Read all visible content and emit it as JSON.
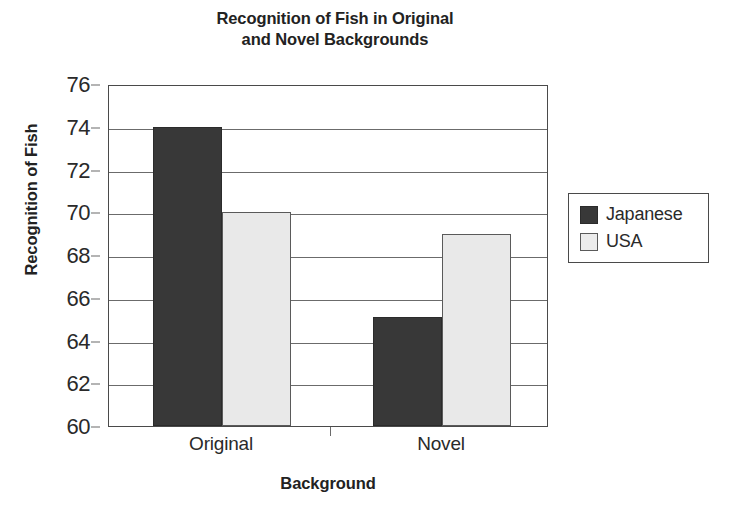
{
  "chart_data": {
    "type": "bar",
    "title": "Recognition of Fish in Original and Novel Backgrounds",
    "title_line1": "Recognition of Fish in Original",
    "title_line2": "and Novel Backgrounds",
    "xlabel": "Background",
    "ylabel": "Recognition of Fish",
    "categories": [
      "Original",
      "Novel"
    ],
    "series": [
      {
        "name": "Japanese",
        "values": [
          74,
          65.1
        ],
        "color": "#383838"
      },
      {
        "name": "USA",
        "values": [
          70,
          69
        ],
        "color": "#e9e9e9"
      }
    ],
    "ylim": [
      60,
      76
    ],
    "yticks": [
      60,
      62,
      64,
      66,
      68,
      70,
      72,
      74,
      76
    ],
    "ytick_labels": [
      "60",
      "62",
      "64",
      "66",
      "68",
      "70",
      "72",
      "74",
      "76"
    ],
    "grid": true,
    "grid_axis": "y",
    "legend_position": "right",
    "legend_entries": [
      "Japanese",
      "USA"
    ],
    "background_color": "#ffffff",
    "axis_color": "#4a4a4a"
  }
}
